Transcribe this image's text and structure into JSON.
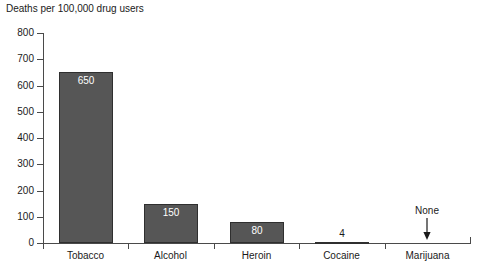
{
  "chart_data": {
    "type": "bar",
    "title": "Deaths per 100,000 drug users",
    "xlabel": "",
    "ylabel": "",
    "ylim": [
      0,
      800
    ],
    "yticks": [
      0,
      100,
      200,
      300,
      400,
      500,
      600,
      700,
      800
    ],
    "grid": false,
    "legend": null,
    "categories": [
      "Tobacco",
      "Alcohol",
      "Heroin",
      "Cocaine",
      "Marijuana"
    ],
    "values": [
      650,
      150,
      80,
      4,
      0
    ],
    "value_labels": [
      "650",
      "150",
      "80",
      "4",
      "None"
    ],
    "annotations": [
      {
        "text": "None",
        "category": "Marijuana",
        "marker": "down-arrow",
        "note": "Marijuana has no recorded deaths; arrow points to the zero baseline"
      }
    ],
    "colors": {
      "bar_fill": "#565656",
      "bar_border": "#2f2f2f",
      "axis": "#4a4a4a",
      "text": "#1a1a1a",
      "value_label_inside": "#ffffff",
      "background": "#ffffff"
    }
  },
  "axis": {
    "y_tick_labels": [
      "800",
      "700",
      "600",
      "500",
      "400",
      "300",
      "200",
      "100",
      "0"
    ]
  },
  "bars": [
    {
      "label": "Tobacco",
      "value_label": "650"
    },
    {
      "label": "Alcohol",
      "value_label": "150"
    },
    {
      "label": "Heroin",
      "value_label": "80"
    },
    {
      "label": "Cocaine",
      "value_label": "4"
    },
    {
      "label": "Marijuana",
      "value_label": "None"
    }
  ],
  "footer": {
    "bleed_text": ""
  }
}
